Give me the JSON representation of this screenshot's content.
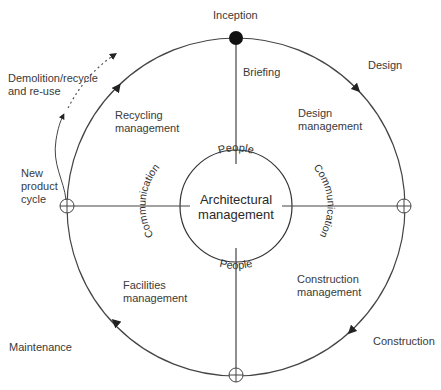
{
  "diagram": {
    "center_label": [
      "Architectural",
      "management"
    ],
    "inner_ring": {
      "top": "People",
      "bottom": "People",
      "left": "Communication",
      "right": "Communication"
    },
    "outer_stages": {
      "top": "Inception",
      "top_right": "Design",
      "bottom_right": "Construction",
      "bottom_left": "Maintenance"
    },
    "quadrants": {
      "top": "Briefing",
      "top_right": [
        "Design",
        "management"
      ],
      "bottom_right": [
        "Construction",
        "management"
      ],
      "bottom_left": [
        "Facilities",
        "management"
      ],
      "top_left": [
        "Recycling",
        "management"
      ]
    },
    "side_notes": {
      "demolition": [
        "Demolition/recycle",
        "and re-use"
      ],
      "new_cycle": [
        "New",
        "product",
        "cycle"
      ]
    },
    "colors": {
      "line": "#444444",
      "text": "#3a3a3a",
      "background": "#ffffff"
    }
  }
}
